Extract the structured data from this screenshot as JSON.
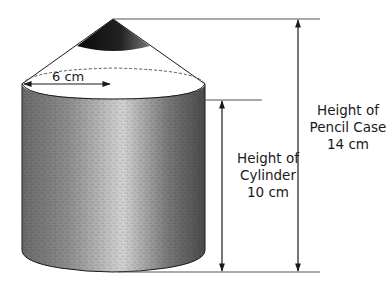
{
  "diagram": {
    "radius_label": "6 cm",
    "cylinder_height": {
      "line1": "Height of",
      "line2": "Cylinder",
      "line3": "10 cm"
    },
    "pencil_case_height": {
      "line1": "Height of",
      "line2": "Pencil Case",
      "line3": "14 cm"
    },
    "colors": {
      "stroke": "#1a1a1a",
      "tip": "#111111",
      "cylinder_dark": "#555555",
      "cylinder_light": "#d8d8d8",
      "background": "#ffffff"
    }
  }
}
